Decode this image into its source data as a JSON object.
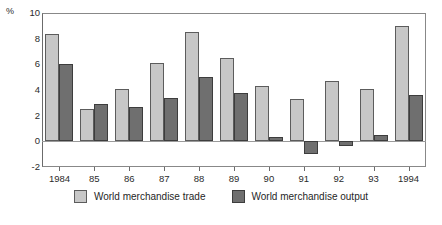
{
  "chart_data": {
    "type": "bar",
    "title": "",
    "xlabel": "",
    "ylabel": "%",
    "ylim": [
      -2,
      10
    ],
    "yticks": [
      -2,
      0,
      2,
      4,
      6,
      8,
      10
    ],
    "grid": false,
    "legend_position": "bottom",
    "categories": [
      "1984",
      "85",
      "86",
      "87",
      "88",
      "89",
      "90",
      "91",
      "92",
      "93",
      "1994"
    ],
    "series": [
      {
        "name": "World merchandise trade",
        "color": "#c7c7c7",
        "values": [
          8.4,
          2.5,
          4.1,
          6.1,
          8.5,
          6.5,
          4.3,
          3.3,
          4.7,
          4.1,
          9.0
        ]
      },
      {
        "name": "World merchandise output",
        "color": "#6f6f6f",
        "values": [
          6.0,
          2.9,
          2.7,
          3.4,
          5.0,
          3.8,
          0.3,
          -1.0,
          -0.4,
          0.5,
          3.6
        ]
      }
    ]
  },
  "axis": {
    "unit_label": "%"
  },
  "source": {
    "text": ""
  }
}
